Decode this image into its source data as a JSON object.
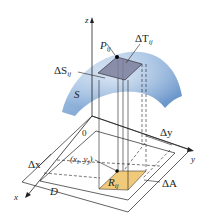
{
  "figure": {
    "labels": {
      "z_axis": "z",
      "x_axis": "x",
      "y_axis": "y",
      "origin": "0",
      "point_P": "P",
      "point_P_sub": "ij",
      "tangent_patch": "ΔT",
      "tangent_patch_sub": "ij",
      "surface_patch": "ΔS",
      "surface_patch_sub": "ij",
      "surface": "S",
      "point_xy": "(x",
      "point_xy_i": "i",
      "point_xy_mid": ", y",
      "point_xy_j": "j",
      "point_xy_close": ")",
      "region": "D",
      "subrect": "R",
      "subrect_sub": "ij",
      "area": "ΔA",
      "delta_x": "Δx",
      "delta_y": "Δy"
    },
    "colors": {
      "surface_fill": "#7ea6d2",
      "surface_light": "#c3d6ec",
      "tangent_fill": "#7d7f9c",
      "subrect_fill": "#f0c97a",
      "line": "#231f20"
    }
  }
}
